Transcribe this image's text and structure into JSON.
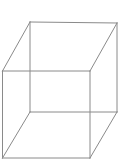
{
  "figure": {
    "canvas": {
      "width": 120,
      "height": 162,
      "background_color": "#ffffff"
    },
    "style": {
      "edge_color": "#8a8a8a",
      "edge_width": 1,
      "fill": "none"
    },
    "vertices": {
      "front_top_left": [
        2.5,
        71
      ],
      "front_top_right": [
        90,
        71
      ],
      "front_bottom_right": [
        90,
        158
      ],
      "front_bottom_left": [
        2.5,
        158
      ],
      "back_top_left": [
        30,
        22
      ],
      "back_top_right": [
        117,
        23
      ],
      "back_bottom_right": [
        117,
        112
      ],
      "back_bottom_left": [
        30,
        112
      ]
    },
    "edges": [
      {
        "name": "front-top",
        "from": "front_top_left",
        "to": "front_top_right"
      },
      {
        "name": "front-right",
        "from": "front_top_right",
        "to": "front_bottom_right"
      },
      {
        "name": "front-bottom",
        "from": "front_bottom_right",
        "to": "front_bottom_left"
      },
      {
        "name": "front-left",
        "from": "front_bottom_left",
        "to": "front_top_left"
      },
      {
        "name": "back-top",
        "from": "back_top_left",
        "to": "back_top_right"
      },
      {
        "name": "back-right",
        "from": "back_top_right",
        "to": "back_bottom_right"
      },
      {
        "name": "back-bottom",
        "from": "back_bottom_right",
        "to": "back_bottom_left"
      },
      {
        "name": "back-left",
        "from": "back_bottom_left",
        "to": "back_top_left"
      },
      {
        "name": "connector-top-left",
        "from": "front_top_left",
        "to": "back_top_left"
      },
      {
        "name": "connector-top-right",
        "from": "front_top_right",
        "to": "back_top_right"
      },
      {
        "name": "connector-bottom-right",
        "from": "front_bottom_right",
        "to": "back_bottom_right"
      },
      {
        "name": "connector-bottom-left",
        "from": "front_bottom_left",
        "to": "back_bottom_left"
      }
    ]
  }
}
